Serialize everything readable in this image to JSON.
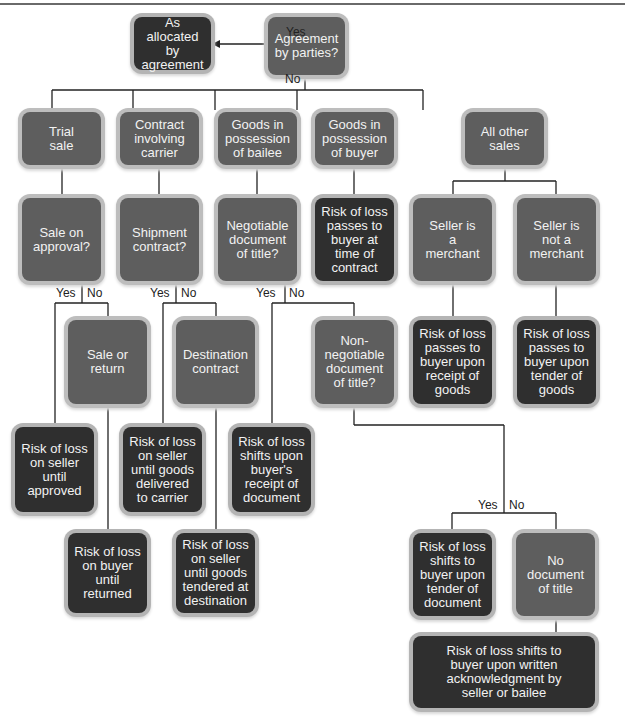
{
  "nodes": {
    "agreement": "Agreement\nby parties?",
    "allocated": "As allocated\nby\nagreement",
    "trial": "Trial\nsale",
    "carrier": "Contract\ninvolving\ncarrier",
    "bailee": "Goods in\npossession\nof bailee",
    "buyer": "Goods in\npossession\nof buyer",
    "other": "All other\nsales",
    "approval": "Sale on\napproval?",
    "shipment": "Shipment\ncontract?",
    "negotiable": "Negotiable\ndocument\nof title?",
    "buyer_contract": "Risk of loss\npasses to\nbuyer at\ntime of\ncontract",
    "merchant": "Seller is\na\nmerchant",
    "not_merchant": "Seller is\nnot a\nmerchant",
    "sale_return": "Sale or\nreturn",
    "destination": "Destination\ncontract",
    "non_negotiable": "Non-\nnegotiable\ndocument\nof title?",
    "receipt_goods": "Risk of loss\npasses to\nbuyer upon\nreceipt of\ngoods",
    "tender_goods": "Risk of loss\npasses to\nbuyer upon\ntender of\ngoods",
    "seller_approved": "Risk of loss\non seller\nuntil\napproved",
    "seller_carrier": "Risk of loss\non seller\nuntil goods\ndelivered\nto carrier",
    "buyer_receipt_doc": "Risk of loss\nshifts upon\nbuyer's\nreceipt of\ndocument",
    "buyer_returned": "Risk of loss\non buyer\nuntil\nreturned",
    "seller_destination": "Risk of loss\non seller\nuntil goods\ntendered at\ndestination",
    "tender_doc": "Risk of loss\nshifts to\nbuyer upon\ntender of\ndocument",
    "no_doc": "No\ndocument\nof title",
    "written_ack": "Risk of loss shifts to\nbuyer upon written\nacknowledgment by\nseller or bailee"
  },
  "labels": {
    "yes": "Yes",
    "no": "No"
  },
  "colors": {
    "question": "#5e5e5e",
    "result": "#2f2f2f",
    "line": "#222222"
  }
}
